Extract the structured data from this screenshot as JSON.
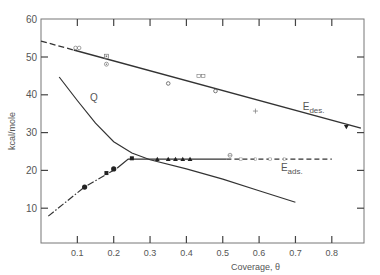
{
  "chart_data": {
    "type": "line",
    "title": "",
    "xlabel": "Coverage, θ",
    "ylabel": "kcal/mole",
    "xlim": [
      0,
      0.89
    ],
    "ylim": [
      0.8,
      60
    ],
    "grid": false,
    "x_ticks": [
      "0.1",
      "0.2",
      "0.3",
      "0.4",
      "0.5",
      "0.6",
      "0.7",
      "0.8"
    ],
    "y_ticks": [
      "10",
      "20",
      "30",
      "40",
      "50",
      "60"
    ],
    "series": [
      {
        "name": "E des.",
        "label": "E",
        "label_sub": "des.",
        "style": "solid with dashed start",
        "line": [
          [
            0.0,
            54.2
          ],
          [
            0.88,
            31.2
          ]
        ],
        "dashed_until": 0.09,
        "points": [
          {
            "x": 0.1,
            "y": 52.4,
            "marker": "open-circles"
          },
          {
            "x": 0.18,
            "y": 50.2,
            "marker": "boxed"
          },
          {
            "x": 0.18,
            "y": 48.1,
            "marker": "dotted-circle"
          },
          {
            "x": 0.35,
            "y": 43.0,
            "marker": "open-circle"
          },
          {
            "x": 0.44,
            "y": 45.0,
            "marker": "double-boxed"
          },
          {
            "x": 0.48,
            "y": 41.0,
            "marker": "open-circle"
          },
          {
            "x": 0.59,
            "y": 35.7,
            "marker": "plus"
          },
          {
            "x": 0.84,
            "y": 31.5,
            "marker": "down-triangle"
          }
        ]
      },
      {
        "name": "Q",
        "label": "Q",
        "style": "solid",
        "line": [
          [
            0.05,
            44.7
          ],
          [
            0.1,
            38.5
          ],
          [
            0.15,
            32.5
          ],
          [
            0.2,
            27.6
          ],
          [
            0.25,
            24.6
          ],
          [
            0.3,
            22.8
          ],
          [
            0.4,
            20.4
          ],
          [
            0.5,
            17.7
          ],
          [
            0.6,
            14.6
          ],
          [
            0.7,
            11.6
          ]
        ]
      },
      {
        "name": "E ads.",
        "label": "E",
        "label_sub": "ads.",
        "style": "dash-dot rising, solid plateau, dashed tail",
        "line": [
          [
            0.02,
            7.9
          ],
          [
            0.12,
            15.6
          ],
          [
            0.21,
            20.6
          ],
          [
            0.24,
            23.0
          ],
          [
            0.51,
            23.0
          ],
          [
            0.8,
            23.0
          ]
        ],
        "solid_from": 0.21,
        "dashed_from": 0.51,
        "points": [
          {
            "x": 0.12,
            "y": 15.6,
            "marker": "filled-circle"
          },
          {
            "x": 0.18,
            "y": 19.3,
            "marker": "filled-square"
          },
          {
            "x": 0.2,
            "y": 20.4,
            "marker": "filled-circle"
          },
          {
            "x": 0.25,
            "y": 23.2,
            "marker": "filled-square"
          },
          {
            "x": 0.32,
            "y": 23.0,
            "marker": "filled-triangle"
          },
          {
            "x": 0.35,
            "y": 23.0,
            "marker": "filled-triangle"
          },
          {
            "x": 0.37,
            "y": 23.0,
            "marker": "filled-triangle"
          },
          {
            "x": 0.39,
            "y": 23.0,
            "marker": "filled-triangle"
          },
          {
            "x": 0.41,
            "y": 23.0,
            "marker": "filled-triangle"
          },
          {
            "x": 0.52,
            "y": 24.0,
            "marker": "crossed-circle"
          }
        ]
      }
    ]
  }
}
